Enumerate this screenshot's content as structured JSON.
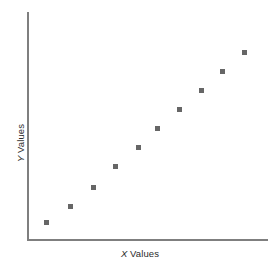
{
  "figure": {
    "background_color": "#ffffff",
    "width": 280,
    "height": 270
  },
  "axes": {
    "line_color": "#7f7f7f",
    "line_width": 2,
    "x_axis": {
      "x_start": 28,
      "x_end": 268,
      "y": 240
    },
    "y_axis": {
      "x": 28,
      "y_start": 12,
      "y_end": 240
    }
  },
  "labels": {
    "x_variable": "X",
    "x_text": " Values",
    "y_variable": "Y",
    "y_text": " Values"
  },
  "marker": {
    "shape": "square",
    "color": "#666666",
    "size_px": 5
  },
  "chart_data": {
    "type": "scatter",
    "title": "",
    "xlabel": "X Values",
    "ylabel": "Y Values",
    "grid": false,
    "legend": false,
    "xlim": [
      0,
      11
    ],
    "ylim": [
      0,
      11
    ],
    "axis_ticks": false,
    "series": [
      {
        "name": "series-1",
        "marker": "square",
        "color": "#666666",
        "x": [
          1,
          2,
          3,
          4,
          5,
          6,
          7,
          8,
          9,
          10
        ],
        "y": [
          1.0,
          1.75,
          2.65,
          3.65,
          4.6,
          5.5,
          6.4,
          7.3,
          8.2,
          9.1
        ],
        "pixel_points": [
          {
            "cx": 46,
            "cy": 222
          },
          {
            "cx": 70,
            "cy": 206
          },
          {
            "cx": 93,
            "cy": 187
          },
          {
            "cx": 115,
            "cy": 166
          },
          {
            "cx": 138,
            "cy": 147
          },
          {
            "cx": 157,
            "cy": 128
          },
          {
            "cx": 179,
            "cy": 109
          },
          {
            "cx": 201,
            "cy": 90
          },
          {
            "cx": 222,
            "cy": 71
          },
          {
            "cx": 244,
            "cy": 52
          }
        ]
      }
    ]
  }
}
